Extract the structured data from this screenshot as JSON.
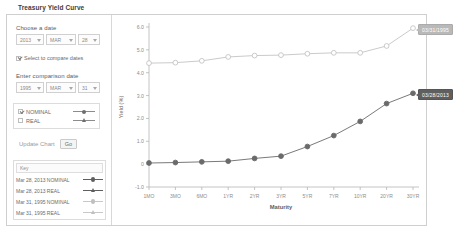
{
  "page": {
    "title": "Treasury Yield Curve"
  },
  "form": {
    "date_label": "Choose a date",
    "date": {
      "year": "2013",
      "month": "MAR",
      "day": "28"
    },
    "compare_checkbox": {
      "label": "Select to compare dates",
      "checked": true
    },
    "comparison_label": "Enter comparison date",
    "comparison_date": {
      "year": "1995",
      "month": "MAR",
      "day": "31"
    },
    "series_options": [
      {
        "label": "NOMINAL",
        "checked": true,
        "marker": "circle"
      },
      {
        "label": "REAL",
        "checked": false,
        "marker": "triangle"
      }
    ],
    "update_label": "Update Chart",
    "go_label": "Go"
  },
  "legend": {
    "key_label": "Key",
    "items": [
      {
        "label": "Mar 28, 2013 NOMINAL",
        "marker": "circle",
        "color": "#5f5f5f"
      },
      {
        "label": "Mar 28, 2013 REAL",
        "marker": "triangle",
        "color": "#5f5f5f"
      },
      {
        "label": "Mar 31, 1995 NOMINAL",
        "marker": "circle",
        "color": "#c0c0c0"
      },
      {
        "label": "Mar 31, 1995 REAL",
        "marker": "triangle",
        "color": "#c0c0c0"
      }
    ]
  },
  "tooltips": {
    "upper": "03/31/1995",
    "lower": "03/28/2013"
  },
  "chart_data": {
    "type": "line",
    "title": "",
    "xlabel": "Maturity",
    "ylabel": "Yield (%)",
    "categories": [
      "1MO",
      "3MO",
      "6MO",
      "1YR",
      "2YR",
      "3YR",
      "5YR",
      "7YR",
      "10YR",
      "20YR",
      "30YR"
    ],
    "ylim": [
      -1.0,
      6.0
    ],
    "yticks": [
      "6.0",
      "5.0",
      "4.0",
      "3.0",
      "2.0",
      "1.0",
      "0",
      "-1.0"
    ],
    "ytick_values": [
      6.0,
      5.0,
      4.0,
      3.0,
      2.0,
      1.0,
      0.0,
      -1.0
    ],
    "grid": false,
    "legend_position": "bottom-left-panel",
    "series": [
      {
        "name": "Mar 31, 1995 NOMINAL",
        "color": "#c4c4c4",
        "marker": "circle-open",
        "values": [
          4.42,
          4.44,
          4.52,
          4.69,
          4.75,
          4.77,
          4.83,
          4.87,
          4.87,
          5.17,
          5.95
        ]
      },
      {
        "name": "Mar 28, 2013 NOMINAL",
        "color": "#6a6a6a",
        "marker": "circle-filled",
        "values": [
          0.05,
          0.07,
          0.1,
          0.13,
          0.25,
          0.35,
          0.77,
          1.25,
          1.87,
          2.65,
          3.1
        ]
      }
    ]
  }
}
